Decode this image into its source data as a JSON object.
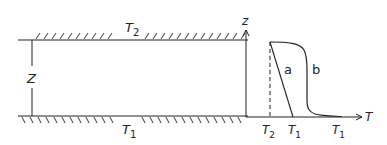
{
  "left_diagram": {
    "top_wall_label": {
      "base": "T",
      "sub": "2"
    },
    "bottom_wall_label": {
      "base": "T",
      "sub": "1"
    },
    "height_label": "Z"
  },
  "right_plot": {
    "y_axis_label": "z",
    "x_axis_label": "T",
    "x_ticks": [
      {
        "base": "T",
        "sub": "2"
      },
      {
        "base": "T",
        "sub": "1"
      },
      {
        "base": "T",
        "sub": "1"
      }
    ],
    "curve_labels": [
      "a",
      "b"
    ]
  },
  "colors": {
    "line": "#222222",
    "background": "#ffffff"
  }
}
